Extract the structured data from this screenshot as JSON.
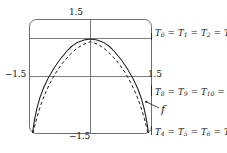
{
  "figure": {
    "name": "polynomial-interpolation-figure",
    "background": "#ffffff",
    "ink_color": "#1a1a1a"
  },
  "axes": {
    "top_tick_label": "1.5",
    "left_tick_label": "−1.5",
    "right_tick_label": "1.5",
    "bottom_tick_label": "−1.5"
  },
  "annotations": {
    "top": {
      "text": "T0 = T1 = T2 = T3",
      "parts": [
        {
          "sym": "T",
          "sub": "0"
        },
        {
          "sym": "T",
          "sub": "1"
        },
        {
          "sym": "T",
          "sub": "2"
        },
        {
          "sym": "T",
          "sub": "3"
        }
      ],
      "separator": "="
    },
    "middle": {
      "text": "T8 = T9 = T10 = T11",
      "parts": [
        {
          "sym": "T",
          "sub": "8"
        },
        {
          "sym": "T",
          "sub": "9"
        },
        {
          "sym": "T",
          "sub": "10"
        },
        {
          "sym": "T",
          "sub": "11"
        }
      ],
      "separator": "="
    },
    "bottom": {
      "text": "T4 = T5 = T6 = T7",
      "parts": [
        {
          "sym": "T",
          "sub": "4"
        },
        {
          "sym": "T",
          "sub": "5"
        },
        {
          "sym": "T",
          "sub": "6"
        },
        {
          "sym": "T",
          "sub": "7"
        }
      ],
      "separator": "="
    },
    "function_label": "f"
  },
  "chart_data": {
    "type": "line",
    "title": "",
    "xlabel": "",
    "ylabel": "",
    "xlim": [
      -1.5,
      1.5
    ],
    "ylim": [
      -1.5,
      1.5
    ],
    "grid": false,
    "axis_style": "centered-crosshair-in-rounded-frame",
    "legend": "inline-annotations",
    "series": [
      {
        "name": "Taylor/Chebyshev approximation",
        "style": "solid",
        "color": "#1a1a1a",
        "x": [
          -1.5,
          -1.38,
          -1.25,
          -1.1,
          -0.95,
          -0.8,
          -0.6,
          -0.4,
          -0.2,
          0.0,
          0.2,
          0.4,
          0.6,
          0.8,
          0.95,
          1.1,
          1.25,
          1.38,
          1.5
        ],
        "y": [
          -1.5,
          -1.05,
          -0.6,
          -0.2,
          0.12,
          0.38,
          0.65,
          0.83,
          0.92,
          0.95,
          0.92,
          0.83,
          0.65,
          0.38,
          0.12,
          -0.2,
          -0.6,
          -1.05,
          -1.5
        ]
      },
      {
        "name": "f",
        "style": "dashed",
        "color": "#1a1a1a",
        "x": [
          -1.5,
          -1.38,
          -1.25,
          -1.1,
          -0.95,
          -0.8,
          -0.6,
          -0.4,
          -0.2,
          0.0,
          0.2,
          0.4,
          0.6,
          0.8,
          0.95,
          1.1,
          1.25,
          1.38,
          1.5
        ],
        "y": [
          -1.5,
          -1.18,
          -0.78,
          -0.35,
          0.02,
          0.32,
          0.62,
          0.82,
          0.92,
          0.95,
          0.92,
          0.82,
          0.62,
          0.32,
          0.02,
          -0.35,
          -0.78,
          -1.18,
          -1.5
        ]
      }
    ],
    "reference_lines": [
      {
        "name": "upper-horizontal-line",
        "orientation": "horizontal",
        "value": 0.95
      },
      {
        "name": "x-axis",
        "orientation": "horizontal",
        "value": 0.0
      },
      {
        "name": "y-axis",
        "orientation": "vertical",
        "value": 0.0
      }
    ]
  }
}
